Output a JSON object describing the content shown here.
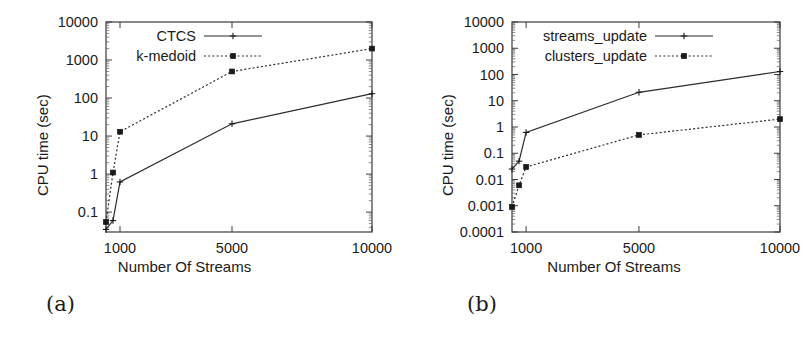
{
  "figure": {
    "panels": [
      {
        "caption": "(a)",
        "xlabel": "Number Of Streams",
        "ylabel": "CPU time (sec)"
      },
      {
        "caption": "(b)",
        "xlabel": "Number Of Streams",
        "ylabel": "CPU time (sec)"
      }
    ]
  },
  "chart_data": [
    {
      "type": "line",
      "title": "(a)",
      "xlabel": "Number Of Streams",
      "ylabel": "CPU time (sec)",
      "xscale": "linear",
      "yscale": "log",
      "xlim": [
        500,
        10000
      ],
      "ylim": [
        0.03,
        10000
      ],
      "xticks": [
        1000,
        5000,
        10000
      ],
      "xtick_labels": [
        "1000",
        "5000",
        "10000"
      ],
      "yticks": [
        0.1,
        1,
        10,
        100,
        1000,
        10000
      ],
      "ytick_labels": [
        "0.1",
        "1",
        "10",
        "100",
        "1000",
        "10000"
      ],
      "grid": false,
      "legend_position": "top-center",
      "x": [
        500,
        750,
        1000,
        5000,
        10000
      ],
      "series": [
        {
          "name": "CTCS",
          "style": "solid",
          "marker": "plus",
          "values": [
            0.035,
            0.06,
            0.62,
            21,
            130
          ]
        },
        {
          "name": "k-medoid",
          "style": "dotted",
          "marker": "square",
          "values": [
            0.055,
            1.1,
            13,
            500,
            2000
          ]
        }
      ]
    },
    {
      "type": "line",
      "title": "(b)",
      "xlabel": "Number Of Streams",
      "ylabel": "CPU time (sec)",
      "xscale": "linear",
      "yscale": "log",
      "xlim": [
        500,
        10000
      ],
      "ylim": [
        0.0001,
        10000
      ],
      "xticks": [
        1000,
        5000,
        10000
      ],
      "xtick_labels": [
        "1000",
        "5000",
        "10000"
      ],
      "yticks": [
        0.0001,
        0.001,
        0.01,
        0.1,
        1,
        10,
        100,
        1000,
        10000
      ],
      "ytick_labels": [
        "0.0001",
        "0.001",
        "0.01",
        "0.1",
        "1",
        "10",
        "100",
        "1000",
        "10000"
      ],
      "grid": false,
      "legend_position": "top-center",
      "x": [
        500,
        750,
        1000,
        5000,
        10000
      ],
      "series": [
        {
          "name": "streams_update",
          "style": "solid",
          "marker": "plus",
          "values": [
            0.025,
            0.05,
            0.62,
            21,
            130
          ]
        },
        {
          "name": "clusters_update",
          "style": "dotted",
          "marker": "square",
          "values": [
            0.0009,
            0.006,
            0.03,
            0.5,
            2.0
          ]
        }
      ]
    }
  ]
}
